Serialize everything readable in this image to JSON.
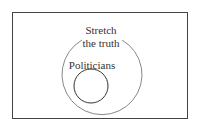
{
  "diagram": {
    "type": "euler",
    "sets": [
      {
        "name": "outer",
        "label_lines": [
          "Stretch",
          "the truth"
        ]
      },
      {
        "name": "inner",
        "label_lines": [
          "Politicians"
        ]
      }
    ],
    "colors": {
      "frame": "#444444",
      "outer_circle": "#888888",
      "inner_circle": "#333333",
      "text": "#333333"
    }
  }
}
